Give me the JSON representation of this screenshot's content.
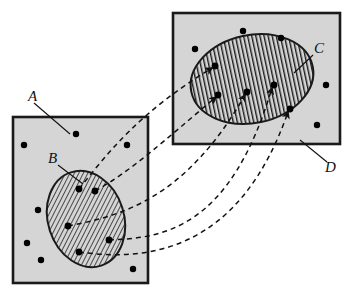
{
  "figure": {
    "type": "set-mapping-diagram",
    "width": 348,
    "height": 294,
    "background_color": "#ffffff",
    "region_fill_color": "#d5d5d5",
    "region_stroke_color": "#1a1a1a",
    "hatch_color": "#1a1a1a",
    "dot_color": "#000000",
    "arrow_color": "#111111"
  },
  "labels": {
    "domain_square": "A",
    "domain_ellipse": "B",
    "codomain_ellipse": "C",
    "codomain_square": "D"
  },
  "regions": {
    "square_a": {
      "name": "A",
      "shape": "square",
      "x": 13,
      "y": 117,
      "width": 135,
      "height": 166,
      "fill": "#d5d5d5"
    },
    "ellipse_b": {
      "name": "B",
      "shape": "ellipse",
      "cx": 86,
      "cy": 219,
      "rx": 38,
      "ry": 49,
      "rotation": -18,
      "hatch": "diagonal",
      "fill": "#d5d5d5"
    },
    "square_d": {
      "name": "D",
      "shape": "rectangle",
      "x": 173,
      "y": 13,
      "width": 167,
      "height": 131,
      "fill": "#d5d5d5"
    },
    "ellipse_c": {
      "name": "C",
      "shape": "ellipse",
      "cx": 252,
      "cy": 79,
      "rx": 62,
      "ry": 44,
      "rotation": -12,
      "hatch": "vertical",
      "fill": "#d5d5d5"
    }
  },
  "points": {
    "in_a_outside_b": [
      {
        "x": 76,
        "y": 134
      },
      {
        "x": 24,
        "y": 145
      },
      {
        "x": 127,
        "y": 145
      },
      {
        "x": 38,
        "y": 210
      },
      {
        "x": 27,
        "y": 243
      },
      {
        "x": 41,
        "y": 260
      },
      {
        "x": 133,
        "y": 269
      }
    ],
    "in_b": [
      {
        "x": 79,
        "y": 189
      },
      {
        "x": 95,
        "y": 191
      },
      {
        "x": 68,
        "y": 226
      },
      {
        "x": 109,
        "y": 240
      },
      {
        "x": 79,
        "y": 252
      }
    ],
    "in_d_outside_c": [
      {
        "x": 243,
        "y": 31
      },
      {
        "x": 281,
        "y": 38
      },
      {
        "x": 195,
        "y": 49
      },
      {
        "x": 326,
        "y": 85
      },
      {
        "x": 317,
        "y": 125
      }
    ],
    "in_c": [
      {
        "x": 215,
        "y": 66
      },
      {
        "x": 218,
        "y": 95
      },
      {
        "x": 247,
        "y": 92
      },
      {
        "x": 274,
        "y": 85
      },
      {
        "x": 290,
        "y": 109
      }
    ]
  },
  "mapping_arrows": [
    {
      "from_point": {
        "x": 79,
        "y": 189
      },
      "to_point": {
        "x": 215,
        "y": 66
      },
      "style": "dashed-curve",
      "arrowhead": true
    },
    {
      "from_point": {
        "x": 95,
        "y": 191
      },
      "to_point": {
        "x": 218,
        "y": 95
      },
      "style": "dashed-curve",
      "arrowhead": true
    },
    {
      "from_point": {
        "x": 68,
        "y": 226
      },
      "to_point": {
        "x": 247,
        "y": 92
      },
      "style": "dashed-curve",
      "arrowhead": true
    },
    {
      "from_point": {
        "x": 109,
        "y": 240
      },
      "to_point": {
        "x": 274,
        "y": 85
      },
      "style": "dashed-curve",
      "arrowhead": true
    },
    {
      "from_point": {
        "x": 79,
        "y": 252
      },
      "to_point": {
        "x": 290,
        "y": 109
      },
      "style": "dashed-curve",
      "arrowhead": true
    }
  ],
  "leader_lines": [
    {
      "label": "A",
      "from": {
        "x": 34,
        "y": 103
      },
      "to": {
        "x": 70,
        "y": 134
      }
    },
    {
      "label": "B",
      "from": {
        "x": 58,
        "y": 165
      },
      "to": {
        "x": 83,
        "y": 184
      }
    },
    {
      "label": "C",
      "from": {
        "x": 313,
        "y": 55
      },
      "to": {
        "x": 294,
        "y": 73
      }
    },
    {
      "label": "D",
      "from": {
        "x": 327,
        "y": 162
      },
      "to": {
        "x": 300,
        "y": 140
      }
    }
  ],
  "label_positions": {
    "A": {
      "x": 28,
      "y": 101
    },
    "B": {
      "x": 48,
      "y": 163
    },
    "C": {
      "x": 314,
      "y": 53
    },
    "D": {
      "x": 325,
      "y": 172
    }
  }
}
